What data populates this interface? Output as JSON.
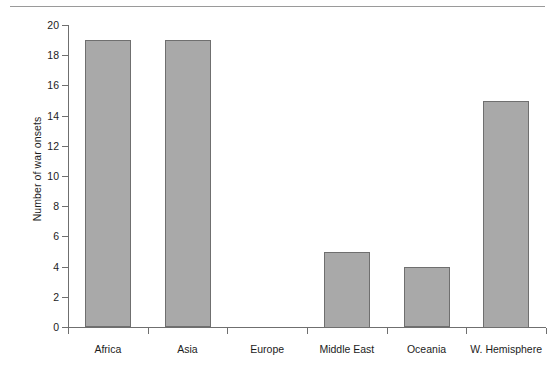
{
  "figure": {
    "background_color": "#ffffff",
    "rule_color": "#9a9a9a",
    "axis_color": "#6f6f6f"
  },
  "chart_data": {
    "type": "bar",
    "title": "",
    "xlabel": "",
    "ylabel": "Number of war onsets",
    "categories": [
      "Africa",
      "Asia",
      "Europe",
      "Middle East",
      "Oceania",
      "W. Hemisphere"
    ],
    "values": [
      19,
      19,
      0,
      5,
      4,
      15
    ],
    "ylim": [
      0,
      20
    ],
    "yticks": [
      0,
      2,
      4,
      6,
      8,
      10,
      12,
      14,
      16,
      18,
      20
    ],
    "ytick_labels": [
      "0",
      "2",
      "4",
      "6",
      "8",
      "10",
      "12",
      "14",
      "16",
      "18",
      "20"
    ],
    "grid": false,
    "legend": false,
    "bar_fill_color": "#a9a9a9",
    "bar_edge_color": "#6f6f6f",
    "series": [
      {
        "name": "Number of war onsets",
        "values": [
          19,
          19,
          0,
          5,
          4,
          15
        ]
      }
    ]
  }
}
